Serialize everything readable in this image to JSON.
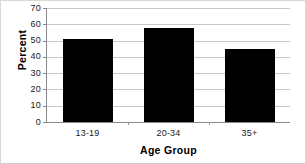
{
  "chart_data": {
    "type": "bar",
    "title": "",
    "subtitle": "",
    "xlabel": "Age Group",
    "ylabel": "Percent",
    "categories": [
      "13-19",
      "20-34",
      "35+"
    ],
    "values": [
      51,
      58,
      45
    ],
    "series": [
      {
        "name": "Percent",
        "values": [
          51,
          58,
          45
        ]
      }
    ],
    "ylim": [
      0,
      70
    ],
    "yticks": [
      0,
      10,
      20,
      30,
      40,
      50,
      60,
      70
    ],
    "ytick_labels": [
      "0",
      "10",
      "20",
      "30",
      "40",
      "50",
      "60",
      "70"
    ],
    "xtick_labels": [
      "13-19",
      "20-34",
      "35+"
    ],
    "grid": "horizontal",
    "legend": "none",
    "bar_color": "#000000",
    "grid_color": "#c8c8c8",
    "axis_color": "#8a8a8a",
    "background_color": "#ffffff",
    "annotations": []
  }
}
